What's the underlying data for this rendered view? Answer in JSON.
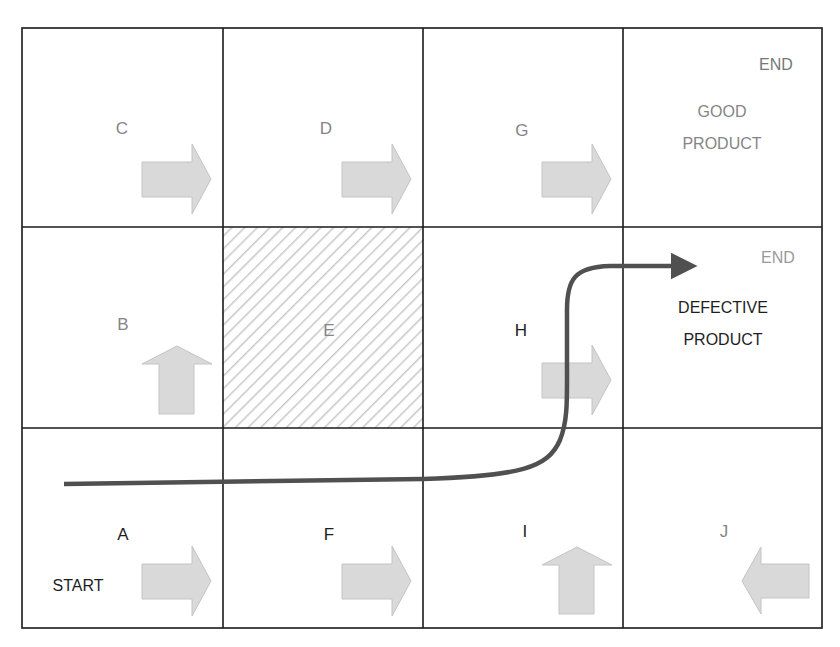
{
  "diagram": {
    "type": "grid-flow",
    "grid": {
      "rows": 3,
      "cols": 4,
      "left": 22,
      "top": 28,
      "cell_width": 200,
      "cell_height": 200
    },
    "colors": {
      "grid_line": "#1a1a1a",
      "arrow_fill": "#d9d9d9",
      "arrow_stroke": "#c4c4c4",
      "path": "#505050",
      "hatch": "#c8c8c8",
      "label_gray": "#858585",
      "label_dark": "#1e1e1e"
    },
    "cells": [
      {
        "id": "C",
        "label": "C",
        "row": 0,
        "col": 0,
        "label_color": "gray",
        "arrow": "right"
      },
      {
        "id": "D",
        "label": "D",
        "row": 0,
        "col": 1,
        "label_color": "gray",
        "arrow": "right"
      },
      {
        "id": "G",
        "label": "G",
        "row": 0,
        "col": 2,
        "label_color": "gray",
        "arrow": "right"
      },
      {
        "id": "good-end",
        "row": 0,
        "col": 3,
        "end_label": "END",
        "product_label_line1": "GOOD",
        "product_label_line2": "PRODUCT",
        "label_color": "gray"
      },
      {
        "id": "B",
        "label": "B",
        "row": 1,
        "col": 0,
        "label_color": "gray",
        "arrow": "up"
      },
      {
        "id": "E",
        "label": "E",
        "row": 1,
        "col": 1,
        "label_color": "gray",
        "hatched": true
      },
      {
        "id": "H",
        "label": "H",
        "row": 1,
        "col": 2,
        "label_color": "dark",
        "arrow": "right"
      },
      {
        "id": "defective-end",
        "row": 1,
        "col": 3,
        "end_label": "END",
        "product_label_line1": "DEFECTIVE",
        "product_label_line2": "PRODUCT",
        "label_color": "dark"
      },
      {
        "id": "A",
        "label": "A",
        "row": 2,
        "col": 0,
        "label_color": "dark",
        "arrow": "right",
        "extra_label": "START"
      },
      {
        "id": "F",
        "label": "F",
        "row": 2,
        "col": 1,
        "label_color": "dark",
        "arrow": "right"
      },
      {
        "id": "I",
        "label": "I",
        "row": 2,
        "col": 2,
        "label_color": "dark",
        "arrow": "up"
      },
      {
        "id": "J",
        "label": "J",
        "row": 2,
        "col": 3,
        "label_color": "gray",
        "arrow": "left"
      }
    ],
    "path": {
      "description": "Dark path from START in A through F and I, up through H, ending right into DEFECTIVE PRODUCT",
      "from": "A",
      "via": [
        "F",
        "I",
        "H"
      ],
      "to": "DEFECTIVE PRODUCT"
    }
  }
}
